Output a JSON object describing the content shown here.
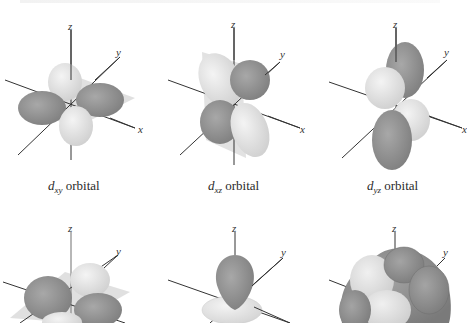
{
  "figure": {
    "colors": {
      "background": "#ffffff",
      "dark_lobe": "#8f8f8f",
      "light_lobe": "#dedede",
      "plane": "#c4c4c4",
      "axis": "#333333"
    },
    "orbitals": [
      {
        "id": "dxy",
        "symbol": "d",
        "subscript": "xy",
        "suffix": " orbital",
        "axes": [
          "z",
          "y",
          "x"
        ]
      },
      {
        "id": "dxz",
        "symbol": "d",
        "subscript": "xz",
        "suffix": " orbital",
        "axes": [
          "z",
          "y",
          "x"
        ]
      },
      {
        "id": "dyz",
        "symbol": "d",
        "subscript": "yz",
        "suffix": " orbital",
        "axes": [
          "z",
          "y",
          "x"
        ]
      },
      {
        "id": "dx2y2",
        "axes": [
          "z",
          "y"
        ]
      },
      {
        "id": "dz2",
        "axes": [
          "z",
          "y"
        ]
      },
      {
        "id": "all-d",
        "axes": [
          "z",
          "y"
        ]
      }
    ]
  }
}
